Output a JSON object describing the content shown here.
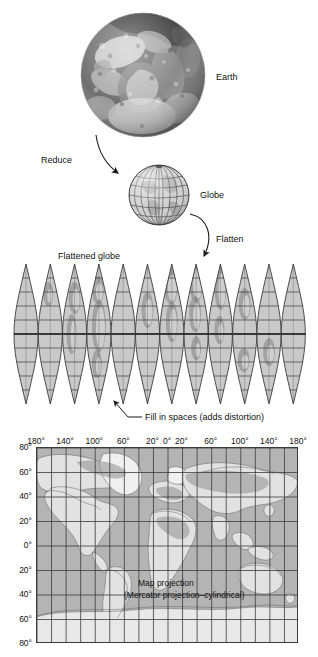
{
  "figure": {
    "labels": {
      "earth": "Earth",
      "reduce": "Reduce",
      "globe": "Globe",
      "flatten": "Flatten",
      "flattened_globe": "Flattened globe",
      "fill_in_spaces": "Fill in spaces (adds distortion)",
      "map_projection": "Map projection",
      "map_projection_sub": "(Mercator projection–cylindrical)"
    }
  },
  "gores": {
    "count": 12,
    "parallel_labels": []
  },
  "map": {
    "longitude_ticks": [
      "180°",
      "140°",
      "100°",
      "60°",
      "20°",
      "0°",
      "20°",
      "60°",
      "100°",
      "140°",
      "180°"
    ],
    "longitude_values": [
      -180,
      -140,
      -100,
      -60,
      -20,
      0,
      20,
      60,
      100,
      140,
      180
    ],
    "latitude_ticks": [
      "80°",
      "60°",
      "40°",
      "20°",
      "0°",
      "20°",
      "40°",
      "60°",
      "80°"
    ],
    "latitude_values": [
      80,
      60,
      40,
      20,
      0,
      -20,
      -40,
      -60,
      -80
    ],
    "grid_spacing_degrees": 20
  },
  "colors": {
    "ink": "#1a1a1a",
    "grid": "#3b3b3b",
    "ocean": "#b9b9b9",
    "land": "#dedede",
    "gore_fill": "#c9c9c9",
    "gore_line": "#3a3a3a",
    "paper": "#ffffff"
  }
}
